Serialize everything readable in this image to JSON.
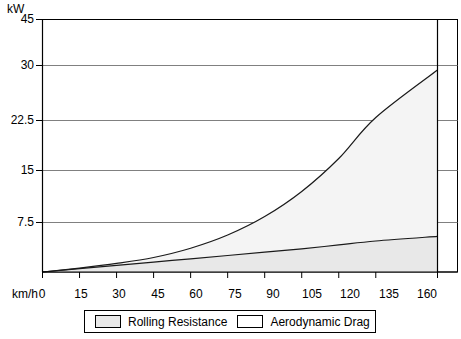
{
  "chart_data": {
    "type": "area",
    "title": "",
    "xlabel": "km/h",
    "ylabel": "kW",
    "grid": true,
    "legend_position": "bottom",
    "x": [
      0,
      15,
      30,
      45,
      60,
      75,
      90,
      105,
      120,
      135,
      160
    ],
    "xtick_labels": [
      "0",
      "15",
      "30",
      "45",
      "60",
      "75",
      "90",
      "105",
      "120",
      "135",
      "160"
    ],
    "ytick_labels": [
      "45",
      "30",
      "22.5",
      "15",
      "7.5"
    ],
    "ylim": [
      0,
      45
    ],
    "xlim": [
      0,
      160
    ],
    "series": [
      {
        "name": "Rolling Resistance",
        "fill": "#e8e8e8",
        "values": [
          0.0,
          0.5,
          1.0,
          1.5,
          2.0,
          2.5,
          3.0,
          3.5,
          4.1,
          4.7,
          5.4
        ]
      },
      {
        "name": "Aerodynamic Drag",
        "fill": "#f4f4f4",
        "values": [
          0.0,
          0.6,
          1.3,
          2.2,
          3.6,
          5.6,
          8.4,
          12.2,
          17.2,
          23.4,
          30.6
        ]
      }
    ]
  },
  "axes": {
    "y_unit": "kW",
    "x_unit": "km/h"
  },
  "legend": {
    "items": [
      {
        "label": "Rolling Resistance",
        "swatch_color": "#e8e8e8"
      },
      {
        "label": "Aerodynamic Drag",
        "swatch_color": "#ffffff"
      }
    ]
  },
  "colors": {
    "axis": "#000000",
    "grid": "#808080",
    "curve": "#000000",
    "rolling_fill": "#e8e8e8",
    "drag_fill": "#f4f4f4",
    "background": "#ffffff"
  }
}
